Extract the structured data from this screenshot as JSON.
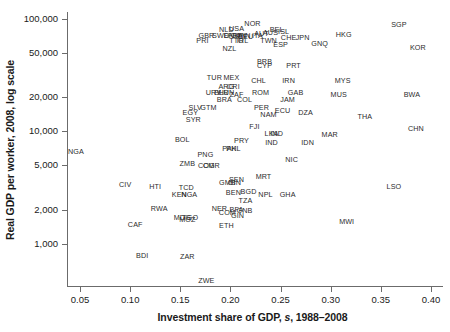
{
  "chart": {
    "type": "scatter",
    "title": "",
    "xlabel_prefix": "Investment share of GDP, ",
    "xlabel_italic": "s",
    "xlabel_suffix": ", 1988–2008",
    "ylabel": "Real GDP per worker, 2008, log scale",
    "xticks": [
      "0.05",
      "0.10",
      "0.15",
      "0.20",
      "0.25",
      "0.30",
      "0.35",
      "0.40"
    ],
    "yticks": [
      "100,000",
      "50,000",
      "20,000",
      "10,000",
      "5,000",
      "2,000",
      "1,000"
    ]
  },
  "chart_data": {
    "type": "scatter",
    "title": "",
    "xlabel": "Investment share of GDP, s, 1988-2008",
    "ylabel": "Real GDP per worker, 2008, log scale",
    "yscale": "log",
    "xscale": "linear",
    "xlim": [
      0.037,
      0.412
    ],
    "ylim": [
      420,
      115000
    ],
    "xtick_values": [
      0.05,
      0.1,
      0.15,
      0.2,
      0.25,
      0.3,
      0.35,
      0.4
    ],
    "xtick_labels": [
      "0.05",
      "0.10",
      "0.15",
      "0.20",
      "0.25",
      "0.30",
      "0.35",
      "0.40"
    ],
    "ytick_values": [
      100000,
      50000,
      20000,
      10000,
      5000,
      2000,
      1000
    ],
    "ytick_labels": [
      "100,000",
      "50,000",
      "20,000",
      "10,000",
      "5,000",
      "2,000",
      "1,000"
    ],
    "grid": false,
    "legend": null,
    "marker": "text-label-only",
    "point_label_field": "code",
    "points": [
      {
        "code": "SGP",
        "x": 0.368,
        "y": 88000
      },
      {
        "code": "NOR",
        "x": 0.222,
        "y": 90000
      },
      {
        "code": "USA",
        "x": 0.206,
        "y": 82000
      },
      {
        "code": "NLD",
        "x": 0.196,
        "y": 79000
      },
      {
        "code": "BEL",
        "x": 0.246,
        "y": 80000
      },
      {
        "code": "ISL",
        "x": 0.253,
        "y": 76000
      },
      {
        "code": "AUT",
        "x": 0.231,
        "y": 74000
      },
      {
        "code": "AUS",
        "x": 0.24,
        "y": 75000
      },
      {
        "code": "ITA",
        "x": 0.227,
        "y": 71000
      },
      {
        "code": "GBR",
        "x": 0.176,
        "y": 70000
      },
      {
        "code": "SWE",
        "x": 0.19,
        "y": 70000
      },
      {
        "code": "DNK",
        "x": 0.201,
        "y": 70000
      },
      {
        "code": "FRA",
        "x": 0.205,
        "y": 70000
      },
      {
        "code": "CAN",
        "x": 0.208,
        "y": 70000
      },
      {
        "code": "FIN",
        "x": 0.214,
        "y": 70000
      },
      {
        "code": "DEU",
        "x": 0.215,
        "y": 69000
      },
      {
        "code": "HKG",
        "x": 0.313,
        "y": 72000
      },
      {
        "code": "CHE",
        "x": 0.258,
        "y": 67000
      },
      {
        "code": "JPN",
        "x": 0.272,
        "y": 67000
      },
      {
        "code": "PRI",
        "x": 0.172,
        "y": 63000
      },
      {
        "code": "TTO",
        "x": 0.206,
        "y": 64000
      },
      {
        "code": "IRL",
        "x": 0.212,
        "y": 64000
      },
      {
        "code": "TWN",
        "x": 0.238,
        "y": 63000
      },
      {
        "code": "GNQ",
        "x": 0.289,
        "y": 60000
      },
      {
        "code": "ESP",
        "x": 0.25,
        "y": 59000
      },
      {
        "code": "KOR",
        "x": 0.387,
        "y": 55000
      },
      {
        "code": "NZL",
        "x": 0.199,
        "y": 54000
      },
      {
        "code": "BRB",
        "x": 0.234,
        "y": 41000
      },
      {
        "code": "CYP",
        "x": 0.234,
        "y": 38000
      },
      {
        "code": "PRT",
        "x": 0.263,
        "y": 38000
      },
      {
        "code": "MEX",
        "x": 0.201,
        "y": 30000
      },
      {
        "code": "TUR",
        "x": 0.184,
        "y": 30000
      },
      {
        "code": "CHL",
        "x": 0.228,
        "y": 28000
      },
      {
        "code": "IRN",
        "x": 0.258,
        "y": 28000
      },
      {
        "code": "MYS",
        "x": 0.312,
        "y": 28000
      },
      {
        "code": "ARG",
        "x": 0.196,
        "y": 25000
      },
      {
        "code": "CRI",
        "x": 0.203,
        "y": 25000
      },
      {
        "code": "URY",
        "x": 0.183,
        "y": 22000
      },
      {
        "code": "BLR",
        "x": 0.191,
        "y": 22000
      },
      {
        "code": "HUN",
        "x": 0.196,
        "y": 22000
      },
      {
        "code": "ZAF",
        "x": 0.206,
        "y": 21000
      },
      {
        "code": "ROM",
        "x": 0.23,
        "y": 22000
      },
      {
        "code": "GAB",
        "x": 0.265,
        "y": 22000
      },
      {
        "code": "MUS",
        "x": 0.308,
        "y": 21000
      },
      {
        "code": "BWA",
        "x": 0.381,
        "y": 21000
      },
      {
        "code": "JAM",
        "x": 0.257,
        "y": 19000
      },
      {
        "code": "BRA",
        "x": 0.194,
        "y": 19000
      },
      {
        "code": "COL",
        "x": 0.214,
        "y": 19000
      },
      {
        "code": "SLV",
        "x": 0.165,
        "y": 16000
      },
      {
        "code": "GTM",
        "x": 0.178,
        "y": 16000
      },
      {
        "code": "PER",
        "x": 0.231,
        "y": 16000
      },
      {
        "code": "EGY",
        "x": 0.16,
        "y": 14500
      },
      {
        "code": "ECU",
        "x": 0.252,
        "y": 15000
      },
      {
        "code": "NAM",
        "x": 0.238,
        "y": 14000
      },
      {
        "code": "DZA",
        "x": 0.275,
        "y": 14500
      },
      {
        "code": "THA",
        "x": 0.334,
        "y": 13500
      },
      {
        "code": "SYR",
        "x": 0.163,
        "y": 12500
      },
      {
        "code": "FJI",
        "x": 0.224,
        "y": 11000
      },
      {
        "code": "CHN",
        "x": 0.385,
        "y": 10500
      },
      {
        "code": "LKA",
        "x": 0.241,
        "y": 9500
      },
      {
        "code": "IND",
        "x": 0.246,
        "y": 9500
      },
      {
        "code": "MAR",
        "x": 0.299,
        "y": 9300
      },
      {
        "code": "BOL",
        "x": 0.152,
        "y": 8400
      },
      {
        "code": "PRY",
        "x": 0.211,
        "y": 8200
      },
      {
        "code": "IND2",
        "x": 0.241,
        "y": 7800
      },
      {
        "code": "IDN",
        "x": 0.277,
        "y": 7800
      },
      {
        "code": "PHL",
        "x": 0.203,
        "y": 7000
      },
      {
        "code": "PAK",
        "x": 0.199,
        "y": 7000
      },
      {
        "code": "NGA",
        "x": 0.046,
        "y": 6500
      },
      {
        "code": "PNG",
        "x": 0.175,
        "y": 6200
      },
      {
        "code": "NIC",
        "x": 0.261,
        "y": 5600
      },
      {
        "code": "ZMB",
        "x": 0.157,
        "y": 5100
      },
      {
        "code": "COG",
        "x": 0.176,
        "y": 4950
      },
      {
        "code": "CMR",
        "x": 0.181,
        "y": 4950
      },
      {
        "code": "MRT",
        "x": 0.233,
        "y": 3900
      },
      {
        "code": "SEN",
        "x": 0.206,
        "y": 3650
      },
      {
        "code": "GIN2",
        "x": 0.204,
        "y": 3500
      },
      {
        "code": "GMB",
        "x": 0.197,
        "y": 3450
      },
      {
        "code": "CIV",
        "x": 0.095,
        "y": 3300
      },
      {
        "code": "HTI",
        "x": 0.125,
        "y": 3200
      },
      {
        "code": "LSO",
        "x": 0.363,
        "y": 3200
      },
      {
        "code": "TCD",
        "x": 0.156,
        "y": 3150
      },
      {
        "code": "BGD",
        "x": 0.218,
        "y": 2900
      },
      {
        "code": "BEN",
        "x": 0.203,
        "y": 2800
      },
      {
        "code": "KEN",
        "x": 0.149,
        "y": 2700
      },
      {
        "code": "NGA2",
        "x": 0.159,
        "y": 2700
      },
      {
        "code": "NPL",
        "x": 0.235,
        "y": 2700
      },
      {
        "code": "GHA",
        "x": 0.257,
        "y": 2700
      },
      {
        "code": "TZA",
        "x": 0.215,
        "y": 2400
      },
      {
        "code": "RWA",
        "x": 0.129,
        "y": 2050
      },
      {
        "code": "NER",
        "x": 0.189,
        "y": 2050
      },
      {
        "code": "BFA",
        "x": 0.206,
        "y": 1980
      },
      {
        "code": "GNB",
        "x": 0.214,
        "y": 1950
      },
      {
        "code": "COM",
        "x": 0.197,
        "y": 1870
      },
      {
        "code": "GIN",
        "x": 0.207,
        "y": 1780
      },
      {
        "code": "MDG",
        "x": 0.152,
        "y": 1700
      },
      {
        "code": "TGO",
        "x": 0.16,
        "y": 1700
      },
      {
        "code": "MOZ",
        "x": 0.157,
        "y": 1620
      },
      {
        "code": "MWI",
        "x": 0.316,
        "y": 1570
      },
      {
        "code": "CAF",
        "x": 0.105,
        "y": 1480
      },
      {
        "code": "ETH",
        "x": 0.196,
        "y": 1430
      },
      {
        "code": "BDI",
        "x": 0.112,
        "y": 780
      },
      {
        "code": "ZAR",
        "x": 0.157,
        "y": 760
      },
      {
        "code": "ZWE",
        "x": 0.176,
        "y": 470
      }
    ]
  }
}
